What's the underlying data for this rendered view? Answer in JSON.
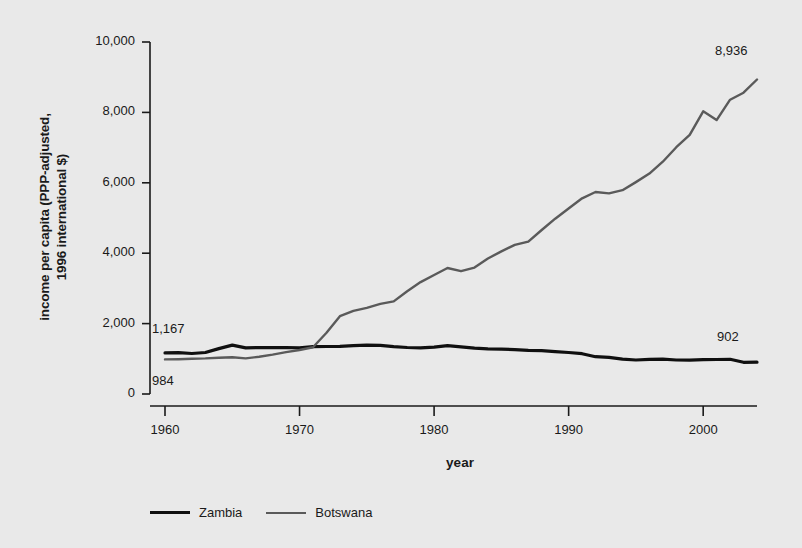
{
  "chart_data": {
    "type": "line",
    "title": "",
    "xlabel": "year",
    "ylabel": "income per capita (PPP-adjusted,\n1996 international $)",
    "xlim": [
      1960,
      2004
    ],
    "ylim": [
      0,
      10000
    ],
    "xticks": [
      "1960",
      "1970",
      "1980",
      "1990",
      "2000"
    ],
    "xtick_values": [
      1960,
      1970,
      1980,
      1990,
      2000
    ],
    "yticks": [
      "0",
      "2,000",
      "4,000",
      "6,000",
      "8,000",
      "10,000"
    ],
    "ytick_values": [
      0,
      2000,
      4000,
      6000,
      8000,
      10000
    ],
    "grid": false,
    "legend_position": "bottom",
    "x": [
      1960,
      1961,
      1962,
      1963,
      1964,
      1965,
      1966,
      1967,
      1968,
      1969,
      1970,
      1971,
      1972,
      1973,
      1974,
      1975,
      1976,
      1977,
      1978,
      1979,
      1980,
      1981,
      1982,
      1983,
      1984,
      1985,
      1986,
      1987,
      1988,
      1989,
      1990,
      1991,
      1992,
      1993,
      1994,
      1995,
      1996,
      1997,
      1998,
      1999,
      2000,
      2001,
      2002,
      2003,
      2004
    ],
    "series": [
      {
        "name": "Zambia",
        "color": "#101010",
        "start_label": "1,167",
        "end_label": "902",
        "values": [
          1167,
          1172,
          1150,
          1180,
          1290,
          1390,
          1310,
          1320,
          1315,
          1320,
          1310,
          1345,
          1350,
          1355,
          1375,
          1390,
          1380,
          1345,
          1320,
          1310,
          1330,
          1375,
          1340,
          1300,
          1285,
          1275,
          1260,
          1240,
          1230,
          1205,
          1180,
          1145,
          1060,
          1040,
          990,
          965,
          985,
          990,
          965,
          960,
          975,
          980,
          985,
          900,
          902
        ]
      },
      {
        "name": "Botswana",
        "color": "#5a5a5a",
        "start_label": "984",
        "end_label": "8,936",
        "values": [
          984,
          990,
          1000,
          1010,
          1030,
          1045,
          1010,
          1060,
          1120,
          1190,
          1250,
          1330,
          1740,
          2210,
          2360,
          2450,
          2560,
          2630,
          2920,
          3180,
          3380,
          3580,
          3490,
          3590,
          3850,
          4050,
          4240,
          4330,
          4660,
          4980,
          5270,
          5560,
          5740,
          5700,
          5790,
          6020,
          6260,
          6600,
          7010,
          7360,
          8030,
          7780,
          8360,
          8560,
          8936
        ]
      }
    ]
  }
}
